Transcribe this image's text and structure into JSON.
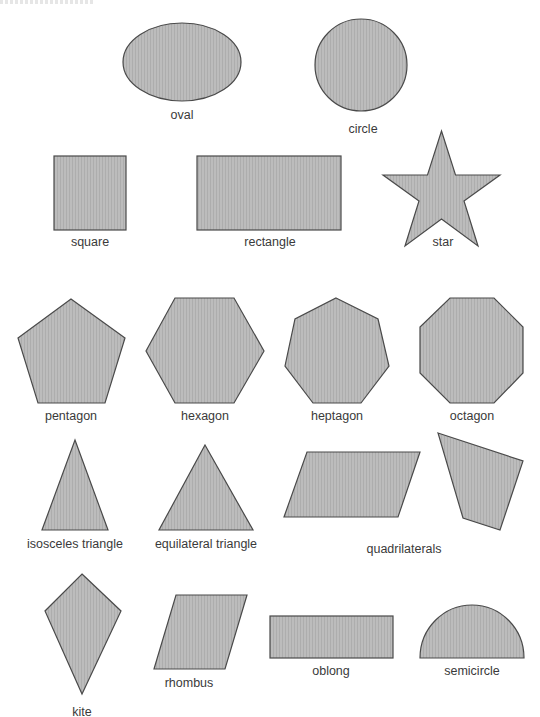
{
  "colors": {
    "fill": "#b9b9b9",
    "fill_stripe": "#aeaeae",
    "stroke": "#4a4a4a",
    "label": "#3a3a3a"
  },
  "shapes": [
    {
      "id": "oval",
      "label": "oval",
      "label_pos": [
        182,
        109
      ]
    },
    {
      "id": "circle",
      "label": "circle",
      "label_pos": [
        363,
        123
      ]
    },
    {
      "id": "square",
      "label": "square",
      "label_pos": [
        90,
        236
      ]
    },
    {
      "id": "rectangle",
      "label": "rectangle",
      "label_pos": [
        270,
        236
      ]
    },
    {
      "id": "star",
      "label": "star",
      "label_pos": [
        443,
        236
      ]
    },
    {
      "id": "pentagon",
      "label": "pentagon",
      "label_pos": [
        71,
        410
      ]
    },
    {
      "id": "hexagon",
      "label": "hexagon",
      "label_pos": [
        205,
        410
      ]
    },
    {
      "id": "heptagon",
      "label": "heptagon",
      "label_pos": [
        337,
        410
      ]
    },
    {
      "id": "octagon",
      "label": "octagon",
      "label_pos": [
        472,
        410
      ]
    },
    {
      "id": "isosceles-triangle",
      "label": "isosceles triangle",
      "label_pos": [
        75,
        538
      ]
    },
    {
      "id": "equilateral-triangle",
      "label": "equilateral triangle",
      "label_pos": [
        206,
        538
      ]
    },
    {
      "id": "quadrilaterals",
      "label": "quadrilaterals",
      "label_pos": [
        404,
        543
      ]
    },
    {
      "id": "kite",
      "label": "kite",
      "label_pos": [
        82,
        706
      ]
    },
    {
      "id": "rhombus",
      "label": "rhombus",
      "label_pos": [
        189,
        677
      ]
    },
    {
      "id": "oblong",
      "label": "oblong",
      "label_pos": [
        331,
        665
      ]
    },
    {
      "id": "semicircle",
      "label": "semicircle",
      "label_pos": [
        472,
        665
      ]
    }
  ]
}
